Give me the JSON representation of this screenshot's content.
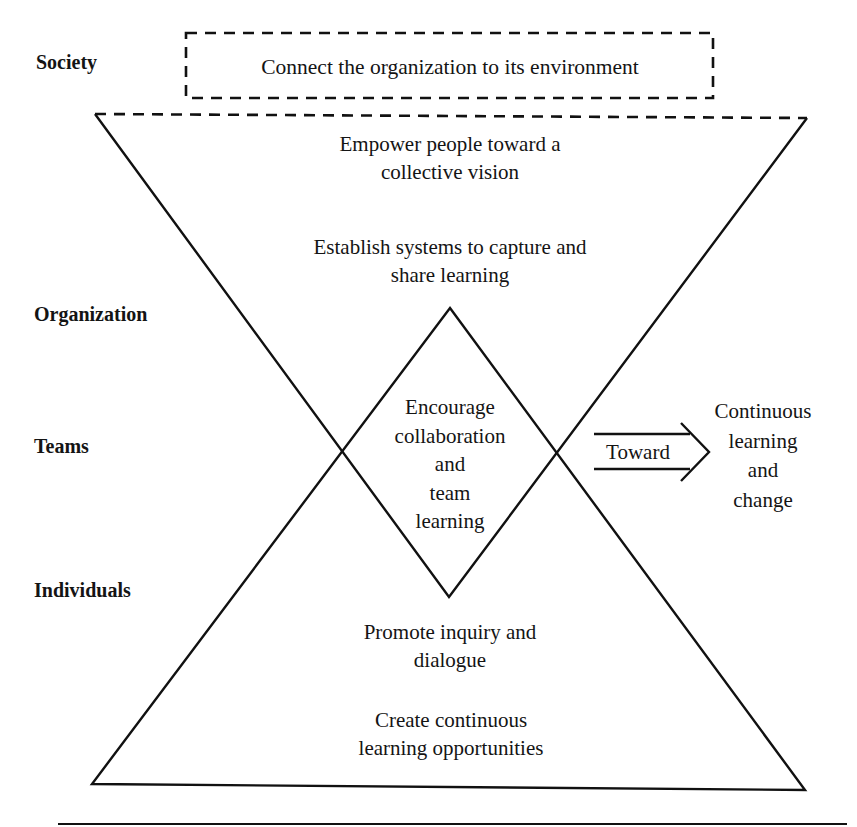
{
  "diagram": {
    "levels": {
      "society": "Society",
      "organization": "Organization",
      "teams": "Teams",
      "individuals": "Individuals"
    },
    "society_box": {
      "text": "Connect the organization to its environment",
      "border_style": "dashed"
    },
    "upper_triangle": {
      "statements": [
        {
          "line1": "Empower people toward a",
          "line2": "collective vision"
        },
        {
          "line1": "Establish systems to capture and",
          "line2": "share learning"
        }
      ]
    },
    "center_diamond": {
      "lines": [
        "Encourage",
        "collaboration",
        "and",
        "team",
        "learning"
      ]
    },
    "lower_triangle": {
      "statements": [
        {
          "line1": "Promote inquiry and",
          "line2": "dialogue"
        },
        {
          "line1": "Create continuous",
          "line2": "learning opportunities"
        }
      ]
    },
    "arrow": {
      "label": "Toward"
    },
    "outcome": {
      "lines": [
        "Continuous",
        "learning",
        "and",
        "change"
      ]
    },
    "colors": {
      "stroke": "#111111",
      "background": "#ffffff"
    }
  }
}
